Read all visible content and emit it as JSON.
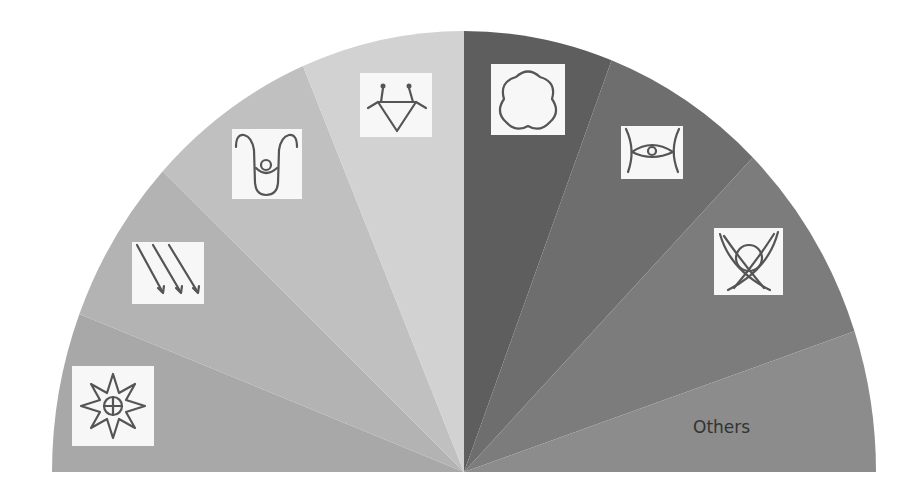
{
  "chart_data": {
    "type": "pie",
    "shape": "semicircle (half donut without hole)",
    "title": "",
    "center": [
      464,
      472
    ],
    "radius_x": 412,
    "radius_y": 441,
    "categories": [
      "eight-pointed star",
      "three diagonal arrows",
      "U-shaped figure",
      "inverted triangle with hooks",
      "quatrefoil",
      "eye between arcs",
      "crossed blades with circle",
      "Others"
    ],
    "values": [
      21,
      22,
      24,
      23,
      21,
      23.5,
      27,
      18.5
    ],
    "angle_span_degrees": 180,
    "colors": [
      "#a8a8a8",
      "#b3b3b3",
      "#c0c0c0",
      "#d2d2d2",
      "#5e5e5e",
      "#6e6e6e",
      "#7c7c7c",
      "#8c8c8c"
    ],
    "legend": "none (symbols used as in-wedge labels)",
    "annotations": [
      {
        "text": "Others",
        "wedge": 7
      }
    ]
  },
  "wedges": [
    {
      "name": "star",
      "start": 180,
      "end": 159,
      "color": "#a8a8a8",
      "icon": "eight-pointed-star-icon"
    },
    {
      "name": "arrows",
      "start": 159,
      "end": 137,
      "color": "#b3b3b3",
      "icon": "diagonal-arrows-icon"
    },
    {
      "name": "u-figure",
      "start": 137,
      "end": 113,
      "color": "#c0c0c0",
      "icon": "u-figure-icon"
    },
    {
      "name": "triangle",
      "start": 113,
      "end": 90,
      "color": "#d2d2d2",
      "icon": "hooked-triangle-icon"
    },
    {
      "name": "quatrefoil",
      "start": 90,
      "end": 69,
      "color": "#5e5e5e",
      "icon": "quatrefoil-icon"
    },
    {
      "name": "eye",
      "start": 69,
      "end": 45.5,
      "color": "#6e6e6e",
      "icon": "eye-arcs-icon"
    },
    {
      "name": "cross",
      "start": 45.5,
      "end": 18.6,
      "color": "#7c7c7c",
      "icon": "crossed-blades-icon"
    },
    {
      "name": "others",
      "start": 18.6,
      "end": 0,
      "color": "#8c8c8c",
      "icon": ""
    }
  ],
  "labels": {
    "others": "Others"
  }
}
